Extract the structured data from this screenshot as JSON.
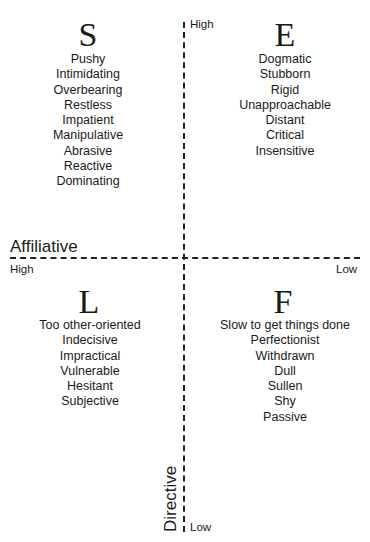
{
  "quadrants": {
    "top_left": {
      "letter": "S",
      "traits": [
        "Pushy",
        "Intimidating",
        "Overbearing",
        "Restless",
        "Impatient",
        "Manipulative",
        "Abrasive",
        "Reactive",
        "Dominating"
      ]
    },
    "top_right": {
      "letter": "E",
      "traits": [
        "Dogmatic",
        "Stubborn",
        "Rigid",
        "Unapproachable",
        "Distant",
        "Critical",
        "Insensitive"
      ]
    },
    "bottom_left": {
      "letter": "L",
      "traits": [
        "Too other-oriented",
        "Indecisive",
        "Impractical",
        "Vulnerable",
        "Hesitant",
        "Subjective"
      ]
    },
    "bottom_right": {
      "letter": "F",
      "traits": [
        "Slow to get things done",
        "Perfectionist",
        "Withdrawn",
        "Dull",
        "Sullen",
        "Shy",
        "Passive"
      ]
    }
  },
  "axes": {
    "vertical": {
      "label": "Directive",
      "high": "High",
      "low": "Low"
    },
    "horizontal": {
      "label": "Affiliative",
      "high": "High",
      "low": "Low"
    }
  }
}
